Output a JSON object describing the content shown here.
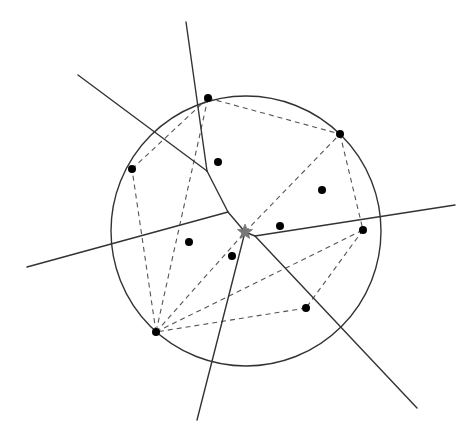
{
  "diagram": {
    "width": 469,
    "height": 439,
    "colors": {
      "background": "#ffffff",
      "solid_line": "#333333",
      "dashed_line": "#555555",
      "point": "#000000",
      "star": "#777777"
    },
    "circle": {
      "cx": 246,
      "cy": 231,
      "r": 135
    },
    "hull_points": [
      {
        "id": "A",
        "x": 208,
        "y": 98
      },
      {
        "id": "B",
        "x": 340,
        "y": 134
      },
      {
        "id": "C",
        "x": 363,
        "y": 230
      },
      {
        "id": "D",
        "x": 306,
        "y": 308
      },
      {
        "id": "E",
        "x": 156,
        "y": 332
      },
      {
        "id": "F",
        "x": 132,
        "y": 169
      }
    ],
    "interior_points": [
      {
        "x": 218,
        "y": 162
      },
      {
        "x": 322,
        "y": 190
      },
      {
        "x": 280,
        "y": 226
      },
      {
        "x": 189,
        "y": 242
      },
      {
        "x": 232,
        "y": 256
      }
    ],
    "star": {
      "x": 245,
      "y": 232,
      "label": "star-marker"
    },
    "dashed_edges": [
      [
        208,
        98,
        340,
        134
      ],
      [
        340,
        134,
        363,
        230
      ],
      [
        363,
        230,
        306,
        308
      ],
      [
        306,
        308,
        156,
        332
      ],
      [
        156,
        332,
        132,
        169
      ],
      [
        132,
        169,
        208,
        98
      ],
      [
        208,
        98,
        156,
        332
      ],
      [
        156,
        332,
        245,
        232
      ],
      [
        245,
        232,
        340,
        134
      ],
      [
        156,
        332,
        363,
        230
      ]
    ],
    "solid_segments": [
      [
        186,
        22,
        207,
        171
      ],
      [
        78,
        75,
        207,
        171
      ],
      [
        207,
        171,
        228,
        212
      ],
      [
        27,
        267,
        228,
        212
      ],
      [
        228,
        212,
        245,
        232
      ],
      [
        245,
        232,
        197,
        420
      ],
      [
        245,
        232,
        255,
        236
      ],
      [
        255,
        236,
        455,
        205
      ],
      [
        255,
        236,
        417,
        408
      ]
    ]
  }
}
